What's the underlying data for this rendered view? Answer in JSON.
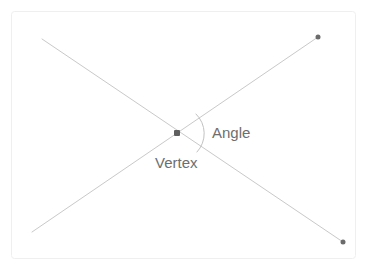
{
  "figure": {
    "type": "geometry-diagram",
    "background_color": "#ffffff",
    "frame": {
      "name": "diagram-frame",
      "x": 11,
      "y": 11,
      "width": 344,
      "height": 247,
      "border_color": "#efefef",
      "border_width": 1,
      "corner_radius": 3,
      "fill": "#ffffff"
    },
    "line_color": "#c9c9c9",
    "line_width": 1,
    "arc_color": "#c2c2c2",
    "dot_color": "#6b6b6b",
    "label_color": "#6e6e6e",
    "lines": [
      {
        "name": "line-upper-left-to-lower-right",
        "x1": 42,
        "y1": 39,
        "x2": 343,
        "y2": 242
      },
      {
        "name": "line-lower-left-to-upper-right",
        "x1": 32,
        "y1": 232,
        "x2": 318,
        "y2": 37
      }
    ],
    "points": [
      {
        "name": "vertex-point",
        "x": 177,
        "y": 133,
        "size": 6,
        "color": "#5f5f5f"
      },
      {
        "name": "endpoint-upper-right",
        "x": 318,
        "y": 37,
        "size": 5,
        "color": "#6b6b6b"
      },
      {
        "name": "endpoint-lower-right",
        "x": 343,
        "y": 242,
        "size": 5,
        "color": "#6b6b6b"
      }
    ],
    "angle_arc": {
      "name": "angle-arc",
      "center_x": 177,
      "center_y": 133,
      "radius": 27,
      "start_x": 196,
      "start_y": 114,
      "end_x": 197,
      "end_y": 152,
      "color": "#c2c2c2",
      "width": 1
    },
    "labels": {
      "angle": "Angle",
      "vertex": "Vertex"
    }
  }
}
